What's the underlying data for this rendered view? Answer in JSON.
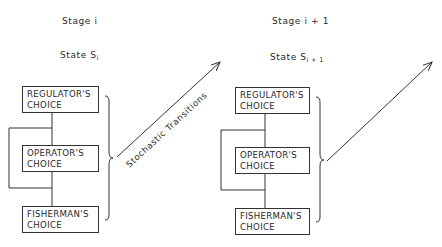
{
  "stages": [
    {
      "stage_label": "Stage i",
      "state_label": "State S",
      "state_subscript": "i",
      "boxes": [
        {
          "line1": "REGULATOR'S",
          "line2": "CHOICE"
        },
        {
          "line1": "OPERATOR'S",
          "line2": "CHOICE"
        },
        {
          "line1": "FISHERMAN'S",
          "line2": "CHOICE"
        }
      ]
    },
    {
      "stage_label": "Stage i + 1",
      "state_label": "State S",
      "state_subscript": "i + 1",
      "boxes": [
        {
          "line1": "REGULATOR'S",
          "line2": "CHOICE"
        },
        {
          "line1": "OPERATOR'S",
          "line2": "CHOICE"
        },
        {
          "line1": "FISHERMAN'S",
          "line2": "CHOICE"
        }
      ]
    }
  ],
  "transition_label": "Stochastic Transitions",
  "colors": {
    "line": "#333333",
    "background": "#ffffff"
  }
}
